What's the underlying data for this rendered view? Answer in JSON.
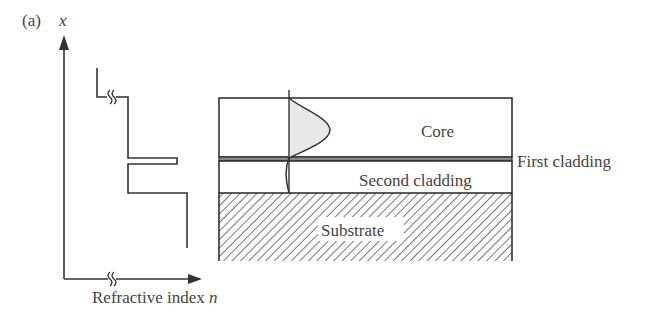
{
  "figure": {
    "panel_label": "(a)",
    "y_axis_label": "x",
    "x_axis_label_text": "Refractive index ",
    "x_axis_label_var": "n"
  },
  "layers": {
    "core": "Core",
    "first_cladding": "First cladding",
    "second_cladding": "Second cladding",
    "substrate": "Substrate"
  },
  "colors": {
    "line": "#333333",
    "text": "#444444",
    "mode_fill": "#e8e8e8",
    "first_cladding_fill": "#888888",
    "hatch": "#555555"
  }
}
